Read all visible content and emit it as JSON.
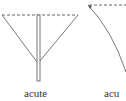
{
  "figures": [
    {
      "label": "acute",
      "type": "cone-with-stem"
    },
    {
      "label": "acu",
      "type": "curved-arc"
    }
  ],
  "colors": {
    "stroke": "#555555",
    "text": "#333333"
  }
}
